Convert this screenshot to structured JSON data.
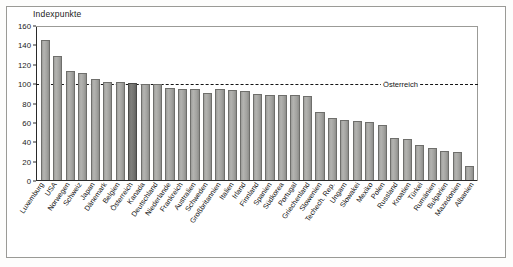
{
  "chart_data": {
    "type": "bar",
    "title": "Indexpunkte",
    "xlabel": "",
    "ylabel": "Indexpunkte",
    "ylim": [
      0,
      160
    ],
    "yticks": [
      0,
      20,
      40,
      60,
      80,
      100,
      120,
      140,
      160
    ],
    "grid": false,
    "legend": "none",
    "reference_line": {
      "value": 100,
      "label": "Österreich",
      "style": "dashed"
    },
    "highlight_category": "Österreich",
    "categories": [
      "Luxemburg",
      "USA",
      "Norwegen",
      "Schweiz",
      "Japan",
      "Dänemark",
      "Belgien",
      "Österreich",
      "Kanada",
      "Deutschland",
      "Niederlande",
      "Frankreich",
      "Australien",
      "Schweden",
      "Großbritannien",
      "Italien",
      "Irland",
      "Finnland",
      "Spanien",
      "Südkorea",
      "Portugal",
      "Griechenland",
      "Slowenien",
      "Techech. Rep.",
      "Ungarn",
      "Slowakei",
      "Mexiko",
      "Polen",
      "Russland",
      "Kroatien",
      "Türkei",
      "Rumänien",
      "Bulgarien",
      "Mazedonien",
      "Albanien"
    ],
    "values": [
      145,
      128,
      113,
      110,
      104,
      101,
      101,
      100,
      99,
      99,
      95,
      94,
      94,
      90,
      94,
      93,
      92,
      89,
      88,
      88,
      88,
      87,
      70,
      64,
      62,
      61,
      60,
      57,
      43,
      42,
      36,
      33,
      30,
      29,
      14
    ]
  }
}
